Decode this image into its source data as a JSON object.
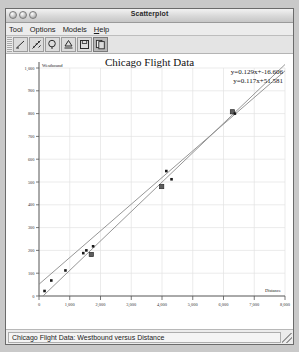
{
  "window": {
    "title": "Scatterplot",
    "controls": [
      "close-button",
      "minimize-button",
      "zoom-button"
    ]
  },
  "menubar": {
    "items": [
      {
        "label": "Tool",
        "name": "menu-tool"
      },
      {
        "label": "Options",
        "name": "menu-options"
      },
      {
        "label": "Models",
        "name": "menu-models"
      },
      {
        "label": "Help",
        "name": "menu-help"
      }
    ]
  },
  "toolbar": {
    "buttons": [
      {
        "name": "line-tool-button",
        "icon": "pencil-line-icon",
        "selected": false
      },
      {
        "name": "scatter-tool-button",
        "icon": "scatter-points-icon",
        "selected": false
      },
      {
        "name": "lasso-tool-button",
        "icon": "magnifier-icon",
        "selected": false
      },
      {
        "name": "print-button",
        "icon": "printer-icon",
        "selected": false
      },
      {
        "name": "save-button",
        "icon": "floppy-disk-icon",
        "selected": false
      },
      {
        "name": "copy-button",
        "icon": "copy-pages-icon",
        "selected": true
      }
    ]
  },
  "statusbar": {
    "text": "Chicago Flight Data: Westbound versus Distance"
  },
  "annotations": {
    "equation1": "y=0.129x+-16.606",
    "equation2": "y=0.117x+51.581"
  },
  "chart_data": {
    "type": "scatter",
    "title": "Chicago Flight Data",
    "xlabel": "Distance",
    "ylabel": "Westbound",
    "xlim": [
      0,
      8000
    ],
    "ylim": [
      0,
      1000
    ],
    "grid": true,
    "xticks": [
      0,
      1000,
      2000,
      3000,
      4000,
      5000,
      6000,
      7000,
      8000
    ],
    "xticklabels": [
      "0",
      "1,000",
      "2,000",
      "3,000",
      "4,000",
      "5,000",
      "6,000",
      "7,000",
      "8,000"
    ],
    "yticks": [
      0,
      100,
      200,
      300,
      400,
      500,
      600,
      700,
      800,
      900,
      1000
    ],
    "yticklabels": [
      "0",
      "100",
      "200",
      "300",
      "400",
      "500",
      "600",
      "700",
      "800",
      "900",
      "1,000"
    ],
    "points": [
      {
        "x": 180,
        "y": 22,
        "marker": "dot"
      },
      {
        "x": 400,
        "y": 68,
        "marker": "dot"
      },
      {
        "x": 860,
        "y": 112,
        "marker": "dot"
      },
      {
        "x": 1440,
        "y": 188,
        "marker": "dot"
      },
      {
        "x": 1540,
        "y": 200,
        "marker": "dot"
      },
      {
        "x": 1700,
        "y": 182,
        "marker": "square"
      },
      {
        "x": 1760,
        "y": 218,
        "marker": "dot"
      },
      {
        "x": 3990,
        "y": 480,
        "marker": "square"
      },
      {
        "x": 4140,
        "y": 548,
        "marker": "dot"
      },
      {
        "x": 4310,
        "y": 512,
        "marker": "dot"
      },
      {
        "x": 6290,
        "y": 808,
        "marker": "square"
      },
      {
        "x": 6370,
        "y": 800,
        "marker": "dot"
      }
    ],
    "series": [
      {
        "name": "fit-line-1",
        "type": "line",
        "slope": 0.129,
        "intercept": -16.606,
        "color": "#8a8a8a"
      },
      {
        "name": "fit-line-2",
        "type": "line",
        "slope": 0.117,
        "intercept": 51.581,
        "color": "#8a8a8a"
      }
    ]
  }
}
